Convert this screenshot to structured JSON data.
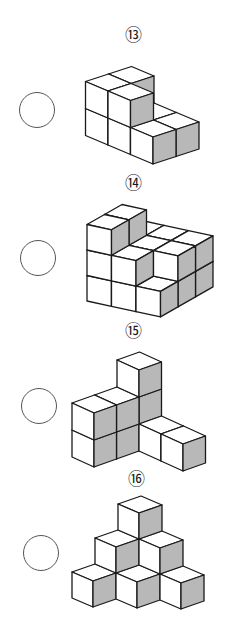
{
  "worksheet": {
    "colors": {
      "line": "#1a1a1a",
      "white_face": "#ffffff",
      "shaded_face": "#b8b8b8",
      "top_face": "#ffffff",
      "circle_stroke": "#555555"
    },
    "problems": [
      {
        "number": 13,
        "label": "⑬",
        "label_pos": [
          133,
          35
        ],
        "answer_circle": {
          "cx": 37,
          "cy": 110,
          "r": 18,
          "value": ""
        },
        "figure": {
          "projection": "isometric",
          "origin": [
            153,
            164
          ],
          "U": [
            23,
            -7.5
          ],
          "V": [
            -22.5,
            -9.5
          ],
          "W": [
            0,
            -27
          ],
          "white_face": {
            "axis": "a",
            "at": 0
          },
          "shaded_face": {
            "axis": "b",
            "at": 0
          },
          "sort": [
            -1,
            -1,
            1
          ],
          "cubes": [
            [
              0,
              0,
              0
            ],
            [
              1,
              0,
              0
            ],
            [
              0,
              1,
              0
            ],
            [
              1,
              1,
              0
            ],
            [
              0,
              2,
              0
            ],
            [
              1,
              2,
              0
            ],
            [
              0,
              1,
              1
            ],
            [
              0,
              2,
              1
            ],
            [
              1,
              2,
              1
            ]
          ]
        }
      },
      {
        "number": 14,
        "label": "⑭",
        "label_pos": [
          133,
          183
        ],
        "answer_circle": {
          "cx": 38,
          "cy": 258,
          "r": 18,
          "value": ""
        },
        "figure": {
          "projection": "oblique",
          "origin": [
            87,
            301
          ],
          "U": [
            24.5,
            5.3
          ],
          "V": [
            17.5,
            -10
          ],
          "W": [
            0,
            -25.5
          ],
          "white_face": {
            "axis": "b",
            "at": 0
          },
          "shaded_face": {
            "axis": "a",
            "at": 1
          },
          "sort": [
            1,
            -1,
            1
          ],
          "cubes": [
            [
              0,
              0,
              0
            ],
            [
              1,
              0,
              0
            ],
            [
              2,
              0,
              0
            ],
            [
              0,
              1,
              0
            ],
            [
              1,
              1,
              0
            ],
            [
              2,
              1,
              0
            ],
            [
              0,
              2,
              0
            ],
            [
              1,
              2,
              0
            ],
            [
              2,
              2,
              0
            ],
            [
              0,
              0,
              1
            ],
            [
              1,
              0,
              1
            ],
            [
              0,
              1,
              1
            ],
            [
              1,
              1,
              1
            ],
            [
              2,
              1,
              1
            ],
            [
              0,
              2,
              1
            ],
            [
              1,
              2,
              1
            ],
            [
              2,
              2,
              1
            ],
            [
              0,
              0,
              2
            ],
            [
              0,
              1,
              2
            ]
          ]
        }
      },
      {
        "number": 15,
        "label": "⑮",
        "label_pos": [
          133,
          331
        ],
        "answer_circle": {
          "cx": 39,
          "cy": 406,
          "r": 18,
          "value": ""
        },
        "figure": {
          "projection": "isometric",
          "origin": [
            94,
            467
          ],
          "U": [
            22.5,
            -8
          ],
          "V": [
            -22,
            -10
          ],
          "W": [
            0,
            -27
          ],
          "white_face": {
            "axis": "a",
            "at": 0
          },
          "shaded_face": {
            "axis": "b",
            "at": 0
          },
          "sort": [
            -1,
            -1,
            1
          ],
          "cubes": [
            [
              0,
              0,
              0
            ],
            [
              1,
              0,
              0
            ],
            [
              2,
              0,
              0
            ],
            [
              0,
              0,
              1
            ],
            [
              1,
              0,
              1
            ],
            [
              2,
              0,
              1
            ],
            [
              2,
              0,
              2
            ],
            [
              2,
              -1,
              0
            ],
            [
              2,
              -2,
              0
            ]
          ]
        }
      },
      {
        "number": 16,
        "label": "⑯",
        "label_pos": [
          136,
          479
        ],
        "answer_circle": {
          "cx": 41,
          "cy": 553,
          "r": 18,
          "value": ""
        },
        "figure": {
          "projection": "isometric",
          "origin": [
            93,
            607
          ],
          "U": [
            23,
            -8
          ],
          "V": [
            -21,
            -9
          ],
          "W": [
            0,
            -26
          ],
          "white_face": {
            "axis": "a",
            "at": 0
          },
          "shaded_face": {
            "axis": "b",
            "at": 0
          },
          "sort": [
            -1,
            -1,
            1
          ],
          "cubes": [
            [
              0,
              0,
              0
            ],
            [
              1,
              -1,
              0
            ],
            [
              2,
              -2,
              0
            ],
            [
              1,
              0,
              1
            ],
            [
              2,
              -1,
              1
            ],
            [
              2,
              0,
              2
            ]
          ]
        }
      }
    ]
  }
}
